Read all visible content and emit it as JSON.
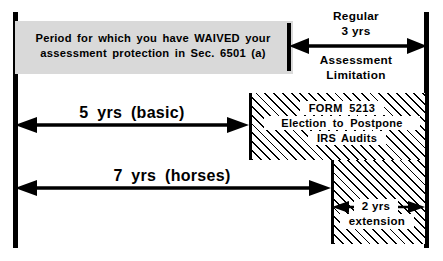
{
  "diagram": {
    "timeline": {
      "left_endpoint_name": "timeline-start-bar",
      "right_endpoint_name": "timeline-end-bar"
    },
    "waiver_band": {
      "text": "Period for which you have WAIVED your\nassessment protection in Sec. 6501 (a)",
      "fill_color": "#d9d9d9"
    },
    "regular_limitation": {
      "label_top": "Regular\n3 yrs",
      "label_bottom": "Assessment\nLimitation",
      "span_years": 3
    },
    "basic_span": {
      "label": "5 yrs   (basic)",
      "years": 5
    },
    "horses_span": {
      "label": "7 yrs   (horses)",
      "years": 7
    },
    "form_box": {
      "line_1": "FORM  5213",
      "line_2": "Election  to  Postpone",
      "line_3": "IRS Audits",
      "fill": "diagonal-hatch"
    },
    "extension_box": {
      "line_1": "2 yrs",
      "line_2": "extension",
      "years": 2,
      "fill": "diagonal-hatch"
    },
    "colors": {
      "ink": "#000000",
      "paper": "#ffffff",
      "band": "#d9d9d9"
    }
  }
}
